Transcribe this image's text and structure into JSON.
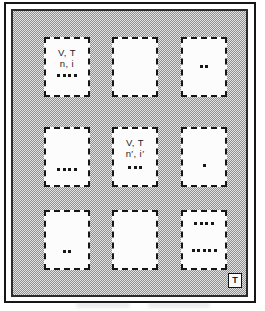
{
  "figure": {
    "type": "ensemble-diagram",
    "bath_temperature_label": "T",
    "colors": {
      "stipple_dark": "#8f8f8f",
      "stipple_light": "#e4e4e4",
      "frame": "#161616",
      "cell_background": "#fcfcfc",
      "dot": "#161616"
    }
  },
  "systems": [
    {
      "position": "top-left",
      "line1": "V, T",
      "line2": "n, i",
      "dots": 4
    },
    {
      "position": "top-center",
      "line1": "",
      "line2": "",
      "dots": 0
    },
    {
      "position": "top-right",
      "line1": "",
      "line2": "",
      "dots": 2
    },
    {
      "position": "middle-left",
      "line1": "",
      "line2": "",
      "dots": 4
    },
    {
      "position": "middle-center",
      "line1": "V, T",
      "line2": "n′, i′",
      "dots": 3
    },
    {
      "position": "middle-right",
      "line1": "",
      "line2": "",
      "dots": 1
    },
    {
      "position": "bottom-left",
      "line1": "",
      "line2": "",
      "dots": 2
    },
    {
      "position": "bottom-center",
      "line1": "",
      "line2": "",
      "dots": 0
    },
    {
      "position": "bottom-right",
      "line1": "",
      "line2": "",
      "dots_top": 4,
      "dots_bottom": 5
    }
  ]
}
